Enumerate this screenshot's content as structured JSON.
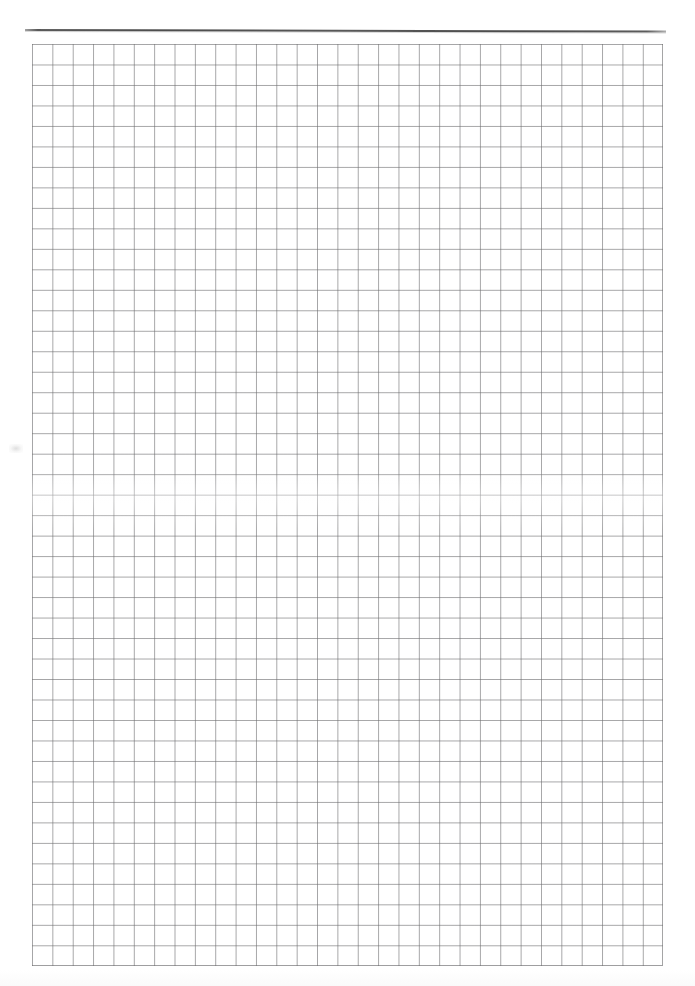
{
  "document": {
    "kind": "scanned-graph-paper-page",
    "page_width": 695,
    "page_height": 986,
    "background_color": "#ffffff",
    "text_content": "",
    "visible_text_count": 0
  },
  "header_rule": {
    "name": "horizontal-rule",
    "color": "#444444",
    "x": 25,
    "y": 29,
    "width": 641,
    "height": 2
  },
  "grid": {
    "name": "graph-paper-grid",
    "line_color": "#6e6e70",
    "cell_fill_color": "#ffffff",
    "x": 32,
    "y": 44,
    "width": 631,
    "height": 922,
    "cell_width": 20.36,
    "cell_height": 20.49,
    "columns": 31,
    "rows": 45
  },
  "artifacts": {
    "margin_smudge": {
      "name": "scan-smudge",
      "x": 9,
      "y": 444,
      "color": "#969696"
    },
    "scan_band": {
      "name": "scan-light-band",
      "y": 470,
      "color": "#ffffff"
    }
  },
  "labels": {
    "page_description": "Blank scanned quadrille graph paper sheet with a single dark horizontal rule near the top edge"
  }
}
